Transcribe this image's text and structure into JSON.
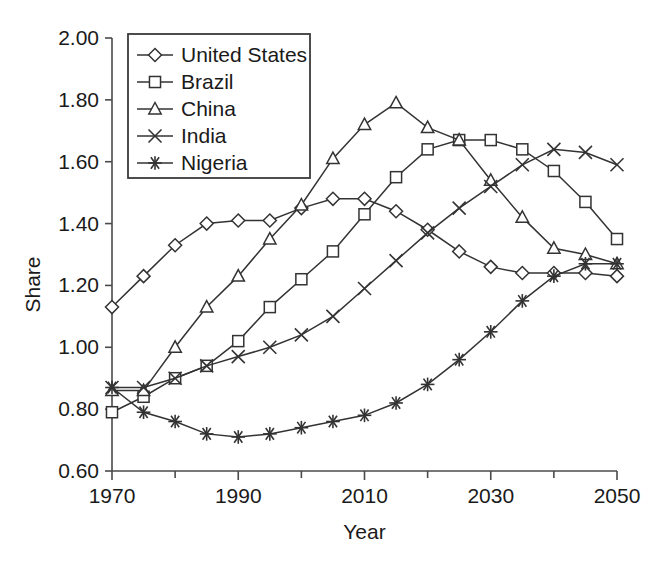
{
  "chart_data": {
    "type": "line",
    "title": "",
    "xlabel": "Year",
    "ylabel": "Share",
    "xlim": [
      1970,
      2050
    ],
    "ylim": [
      0.6,
      2.0
    ],
    "xticks": [
      1970,
      1990,
      2010,
      2030,
      2050
    ],
    "xtick_labels": [
      "1970",
      "1990",
      "2010",
      "2030",
      "2050"
    ],
    "xminorticks": [
      1980,
      2000,
      2020,
      2040
    ],
    "yticks": [
      0.6,
      0.8,
      1.0,
      1.2,
      1.4,
      1.6,
      1.8,
      2.0
    ],
    "ytick_labels": [
      "0.60",
      "0.80",
      "1.00",
      "1.20",
      "1.40",
      "1.60",
      "1.80",
      "2.00"
    ],
    "grid": false,
    "legend_position": "upper-left",
    "x": [
      1970,
      1975,
      1980,
      1985,
      1990,
      1995,
      2000,
      2005,
      2010,
      2015,
      2020,
      2025,
      2030,
      2035,
      2040,
      2045,
      2050
    ],
    "series": [
      {
        "name": "United States",
        "marker": "diamond",
        "color": "#333333",
        "values": [
          1.13,
          1.23,
          1.33,
          1.4,
          1.41,
          1.41,
          1.45,
          1.48,
          1.48,
          1.44,
          1.38,
          1.31,
          1.26,
          1.24,
          1.24,
          1.24,
          1.23
        ]
      },
      {
        "name": "Brazil",
        "marker": "square",
        "color": "#333333",
        "values": [
          0.79,
          0.84,
          0.9,
          0.94,
          1.02,
          1.13,
          1.22,
          1.31,
          1.43,
          1.55,
          1.64,
          1.67,
          1.67,
          1.64,
          1.57,
          1.47,
          1.35
        ]
      },
      {
        "name": "China",
        "marker": "triangle",
        "color": "#333333",
        "values": [
          0.86,
          0.86,
          1.0,
          1.13,
          1.23,
          1.35,
          1.46,
          1.61,
          1.72,
          1.79,
          1.71,
          1.67,
          1.54,
          1.42,
          1.32,
          1.3,
          1.27
        ]
      },
      {
        "name": "India",
        "marker": "cross",
        "color": "#333333",
        "values": [
          0.87,
          0.87,
          0.9,
          0.94,
          0.97,
          1.0,
          1.04,
          1.1,
          1.19,
          1.28,
          1.37,
          1.45,
          1.52,
          1.59,
          1.64,
          1.63,
          1.59
        ]
      },
      {
        "name": "Nigeria",
        "marker": "asterisk",
        "color": "#333333",
        "values": [
          0.87,
          0.79,
          0.76,
          0.72,
          0.71,
          0.72,
          0.74,
          0.76,
          0.78,
          0.82,
          0.88,
          0.96,
          1.05,
          1.15,
          1.23,
          1.27,
          1.27
        ]
      }
    ]
  },
  "legend": {
    "entries": [
      {
        "label": "United States",
        "marker": "diamond"
      },
      {
        "label": "Brazil",
        "marker": "square"
      },
      {
        "label": "China",
        "marker": "triangle"
      },
      {
        "label": "India",
        "marker": "cross"
      },
      {
        "label": "Nigeria",
        "marker": "asterisk"
      }
    ]
  }
}
